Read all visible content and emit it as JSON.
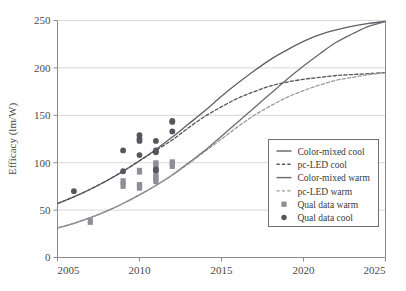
{
  "chart_data": {
    "type": "line",
    "title": "",
    "xlabel": "",
    "ylabel": "Efficacy (lm/W)",
    "xlim": [
      2005,
      2025
    ],
    "ylim": [
      0,
      250
    ],
    "xticks": [
      2005,
      2010,
      2015,
      2020,
      2025
    ],
    "yticks": [
      0,
      50,
      100,
      150,
      200,
      250
    ],
    "grid": "horizontal",
    "legend_position": "center-right",
    "series": [
      {
        "name": "Color-mixed cool",
        "style": "solid",
        "color": "#5f5f66",
        "x": [
          2005,
          2006,
          2007,
          2008,
          2009,
          2010,
          2011,
          2012,
          2013,
          2014,
          2015,
          2016,
          2017,
          2018,
          2019,
          2020,
          2021,
          2022,
          2023,
          2024,
          2025
        ],
        "y": [
          57,
          64,
          72,
          81,
          91,
          102,
          114,
          127,
          141,
          155,
          170,
          184,
          197,
          209,
          219,
          228,
          235,
          240,
          244,
          247,
          249
        ]
      },
      {
        "name": "pc-LED cool",
        "style": "dashed",
        "color": "#54545c",
        "x": [
          2005,
          2006,
          2007,
          2008,
          2009,
          2010,
          2011,
          2012,
          2013,
          2014,
          2015,
          2016,
          2017,
          2018,
          2019,
          2020,
          2021,
          2022,
          2023,
          2024,
          2025
        ],
        "y": [
          57,
          64,
          72,
          81,
          91,
          102,
          113,
          124,
          137,
          149,
          159,
          168,
          175,
          181,
          185,
          188,
          190,
          192,
          193,
          194,
          195
        ]
      },
      {
        "name": "Color-mixed warm",
        "style": "solid",
        "color": "#6a6a72",
        "x": [
          2005,
          2006,
          2007,
          2008,
          2009,
          2010,
          2011,
          2012,
          2013,
          2014,
          2015,
          2016,
          2017,
          2018,
          2019,
          2020,
          2021,
          2022,
          2023,
          2024,
          2025
        ],
        "y": [
          31,
          36,
          42,
          49,
          57,
          66,
          76,
          87,
          100,
          113,
          128,
          143,
          158,
          173,
          188,
          202,
          215,
          227,
          236,
          244,
          249
        ]
      },
      {
        "name": "pc-LED warm",
        "style": "dashed",
        "color": "#9a9aa2",
        "x": [
          2005,
          2006,
          2007,
          2008,
          2009,
          2010,
          2011,
          2012,
          2013,
          2014,
          2015,
          2016,
          2017,
          2018,
          2019,
          2020,
          2021,
          2022,
          2023,
          2024,
          2025
        ],
        "y": [
          31,
          36,
          42,
          49,
          57,
          66,
          76,
          87,
          99,
          112,
          125,
          138,
          150,
          160,
          169,
          176,
          182,
          187,
          190,
          193,
          195
        ]
      }
    ],
    "scatter": [
      {
        "name": "Qual data warm",
        "marker": "square",
        "color": "#8e8e96",
        "points": [
          [
            2007,
            38
          ],
          [
            2009,
            76
          ],
          [
            2009,
            80
          ],
          [
            2010,
            91
          ],
          [
            2010,
            76
          ],
          [
            2010,
            74
          ],
          [
            2011,
            99
          ],
          [
            2011,
            97
          ],
          [
            2011,
            88
          ],
          [
            2011,
            84
          ],
          [
            2011,
            81
          ],
          [
            2012,
            100
          ],
          [
            2012,
            97
          ]
        ]
      },
      {
        "name": "Qual data cool",
        "marker": "circle",
        "color": "#55555d",
        "points": [
          [
            2006,
            70
          ],
          [
            2009,
            113
          ],
          [
            2009,
            91
          ],
          [
            2010,
            129
          ],
          [
            2010,
            125
          ],
          [
            2010,
            123
          ],
          [
            2010,
            108
          ],
          [
            2011,
            123
          ],
          [
            2011,
            113
          ],
          [
            2011,
            111
          ],
          [
            2011,
            93
          ],
          [
            2011,
            92
          ],
          [
            2012,
            144
          ],
          [
            2012,
            143
          ],
          [
            2012,
            133
          ]
        ]
      }
    ]
  },
  "legend": {
    "entries": [
      {
        "label": "Color-mixed cool",
        "kind": "line-solid",
        "color": "#5f5f66"
      },
      {
        "label": "pc-LED cool",
        "kind": "line-dashed",
        "color": "#54545c"
      },
      {
        "label": "Color-mixed warm",
        "kind": "line-solid",
        "color": "#6a6a72"
      },
      {
        "label": "pc-LED warm",
        "kind": "line-dashed",
        "color": "#9a9aa2"
      },
      {
        "label": "Qual data warm",
        "kind": "marker-square",
        "color": "#8e8e96"
      },
      {
        "label": "Qual data cool",
        "kind": "marker-circle",
        "color": "#55555d"
      }
    ]
  },
  "axes": {
    "y_title": "Efficacy (lm/W)",
    "y_tick_labels": [
      "0",
      "50",
      "100",
      "150",
      "200",
      "250"
    ],
    "x_tick_labels": [
      "2005",
      "2010",
      "2015",
      "2020",
      "2025"
    ]
  },
  "colors": {
    "background": "#ffffff",
    "axis": "#8a8a8a",
    "grid": "#d8d8d8",
    "legend_border": "#6f6f6f",
    "text": "#3a3a3a"
  }
}
